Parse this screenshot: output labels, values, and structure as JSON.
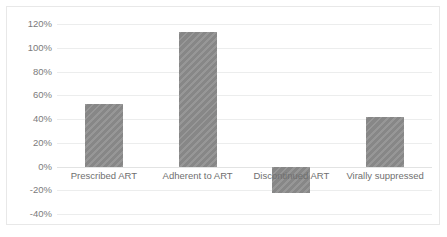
{
  "chart_data": {
    "type": "bar",
    "title": "",
    "subtitle": "",
    "xlabel": "",
    "ylabel": "",
    "categories": [
      "Prescribed ART",
      "Adherent to ART",
      "Discontinued ART",
      "Virally suppressed"
    ],
    "values": [
      53,
      113,
      -22,
      42
    ],
    "value_labels": [
      "53%",
      "113%",
      "-22%",
      "42%"
    ],
    "ylim": [
      -40,
      120
    ],
    "ytick_values": [
      120,
      100,
      80,
      60,
      40,
      20,
      0,
      -20,
      -40
    ],
    "ytick_labels": [
      "120%",
      "100%",
      "80%",
      "60%",
      "40%",
      "20%",
      "0%",
      "-20%",
      "-40%"
    ],
    "ytick_step": 20,
    "grid": true,
    "grid_axis": "y",
    "legend": false,
    "legend_position": "none",
    "series": [
      {
        "name": "",
        "values": [
          53,
          113,
          -22,
          42
        ]
      }
    ],
    "colors": {
      "bar_fill": "#8d8d8d",
      "gridline": "#eceded",
      "zero_line": "#e2e3e3",
      "tick_label": "#7b7b7b",
      "category_label": "#6f6f6f",
      "background": "#ffffff",
      "border": "#e8e8e8"
    }
  }
}
